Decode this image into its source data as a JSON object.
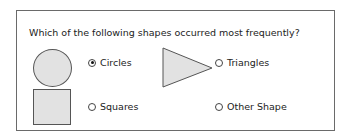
{
  "question": "Which of the following shapes occurred most frequently?",
  "shapes": [
    {
      "name": "circle",
      "fill": "#e2e2e2"
    },
    {
      "name": "triangle",
      "fill": "#e2e2e2"
    },
    {
      "name": "square",
      "fill": "#e2e2e2"
    }
  ],
  "options": [
    {
      "label": "Circles",
      "selected": true
    },
    {
      "label": "Triangles",
      "selected": false
    },
    {
      "label": "Squares",
      "selected": false
    },
    {
      "label": "Other Shape",
      "selected": false
    }
  ]
}
